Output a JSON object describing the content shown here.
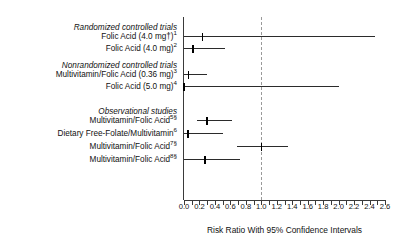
{
  "chart_data": {
    "type": "forest",
    "title": "",
    "xlabel": "Risk Ratio With 95% Confidence Intervals",
    "ylabel": "",
    "xlim": [
      0.0,
      2.6
    ],
    "xticks": [
      "0.0",
      "0.2",
      "0.4",
      "0.6",
      "0.8",
      "1.0",
      "1.2",
      "1.4",
      "1.6",
      "1.8",
      "2.0",
      "2.2",
      "2.4",
      "2.6"
    ],
    "xtick_values": [
      0.0,
      0.2,
      0.4,
      0.6,
      0.8,
      1.0,
      1.2,
      1.4,
      1.6,
      1.8,
      2.0,
      2.2,
      2.4,
      2.6
    ],
    "minor_tick_step": 0.1,
    "reference_line": 1.0,
    "grid": false,
    "legend": "none",
    "groups": [
      {
        "heading": "Randomized controlled trials",
        "rows": [
          {
            "label": "Folic Acid (4.0 mg†)",
            "superscript": "1",
            "estimate": 0.24,
            "ci_low": 0.0,
            "ci_high": 2.47
          },
          {
            "label": "Folic Acid (4.0 mg)",
            "superscript": "2",
            "estimate": 0.12,
            "ci_low": 0.0,
            "ci_high": 0.53
          }
        ]
      },
      {
        "heading": "Nonrandomized controlled trials",
        "rows": [
          {
            "label": "Multivitamin/Folic Acid (0.36 mg)",
            "superscript": "3",
            "estimate": 0.06,
            "ci_low": 0.0,
            "ci_high": 0.3
          },
          {
            "label": "Folic Acid (5.0 mg)",
            "superscript": "4",
            "estimate": 0.0,
            "ci_low": 0.0,
            "ci_high": 2.0
          }
        ]
      },
      {
        "heading": "Observational studies",
        "rows": [
          {
            "label": "Multivitamin/Folic Acid",
            "superscript": "5§",
            "estimate": 0.3,
            "ci_low": 0.17,
            "ci_high": 0.62
          },
          {
            "label": "Dietary Free-Folate/Multivitamin",
            "superscript": "6",
            "estimate": 0.05,
            "ci_low": 0.0,
            "ci_high": 0.5
          },
          {
            "label": "Multivitamin/Folic Acid",
            "superscript": "7§",
            "estimate": 1.0,
            "ci_low": 0.68,
            "ci_high": 1.35
          },
          {
            "label": "Multivitamin/Folic Acid",
            "superscript": "8§",
            "estimate": 0.27,
            "ci_low": 0.0,
            "ci_high": 0.72
          }
        ]
      }
    ]
  },
  "layout": {
    "plot_left_px": 184,
    "plot_right_px": 385,
    "baseline_y_px": 200,
    "axis_top_y_px": 17,
    "row_ys": [
      36,
      48,
      74,
      86,
      120,
      133,
      146,
      159
    ],
    "group_heading_ys": [
      25,
      63,
      109
    ],
    "tick_label_y_px": 203,
    "axis_title_y_px": 225
  }
}
